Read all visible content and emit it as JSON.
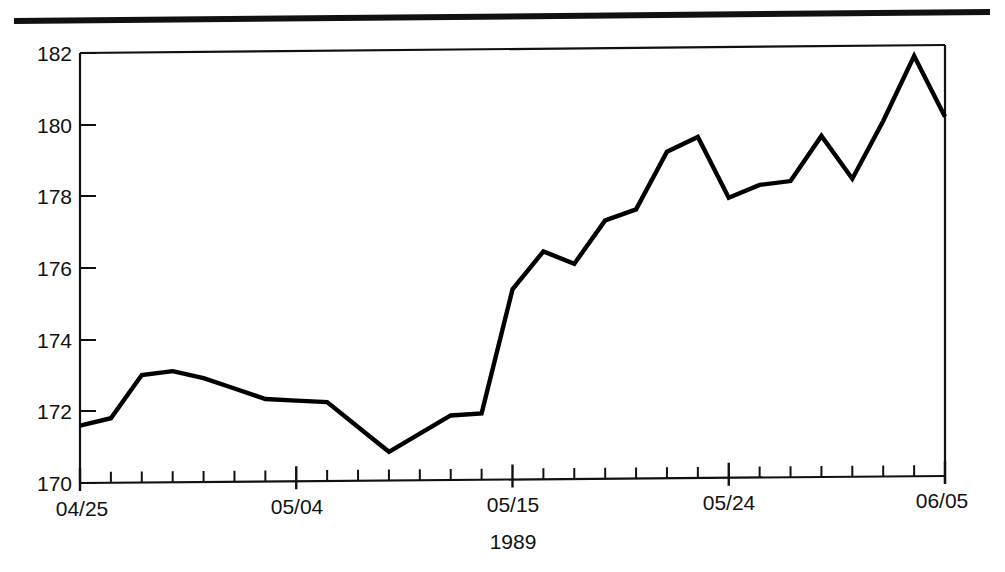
{
  "page": {
    "background_color": "#ffffff",
    "ink_color": "#111111",
    "line_color": "#000000"
  },
  "decoration": {
    "top_rule": "horizontal-rule"
  },
  "chart_data": {
    "type": "line",
    "title": "",
    "subtitle": "",
    "xlabel": "1989",
    "ylabel": "",
    "ylim": [
      170,
      182
    ],
    "xlim": [
      0,
      28
    ],
    "grid": false,
    "legend": null,
    "y_ticks": [
      170,
      172,
      174,
      176,
      178,
      180,
      182
    ],
    "y_tick_labels": [
      "170",
      "172",
      "174",
      "176",
      "178",
      "180",
      "182"
    ],
    "x_tick_labels": [
      "04/25",
      "05/04",
      "05/15",
      "05/24",
      "06/05"
    ],
    "x_tick_label_indices": [
      0,
      7,
      14,
      21,
      28
    ],
    "x_minor_tick_count": 29,
    "x": [
      0,
      1,
      2,
      3,
      4,
      5,
      6,
      7,
      8,
      9,
      10,
      11,
      12,
      13,
      14,
      15,
      16,
      17,
      18,
      19,
      20,
      21,
      22,
      23,
      24,
      25,
      26,
      27,
      28
    ],
    "values": [
      171.6,
      171.8,
      173.0,
      173.1,
      172.9,
      172.6,
      172.3,
      172.25,
      172.2,
      171.5,
      170.8,
      171.3,
      171.8,
      171.85,
      175.3,
      176.35,
      176.0,
      177.2,
      177.5,
      179.1,
      179.5,
      177.8,
      178.15,
      178.25,
      179.5,
      178.3,
      179.9,
      181.7,
      180.0
    ],
    "series": [
      {
        "name": "series-1",
        "values": [
          171.6,
          171.8,
          173.0,
          173.1,
          172.9,
          172.6,
          172.3,
          172.25,
          172.2,
          171.5,
          170.8,
          171.3,
          171.8,
          171.85,
          175.3,
          176.35,
          176.0,
          177.2,
          177.5,
          179.1,
          179.5,
          177.8,
          178.15,
          178.25,
          179.5,
          178.3,
          179.9,
          181.7,
          180.0
        ],
        "color": "#000000"
      }
    ],
    "annotations": []
  }
}
